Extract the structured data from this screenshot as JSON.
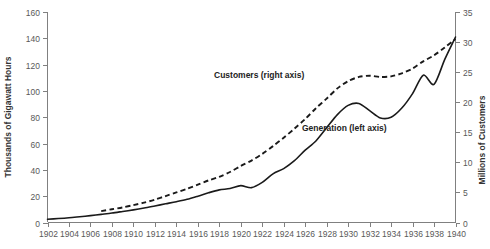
{
  "chart_data": {
    "type": "line",
    "title": "",
    "xlabel": "",
    "ylabel": "Thousands of Gigawatt Hours",
    "y2label": "Millions of Customers",
    "xlim": [
      1902,
      1940
    ],
    "ylim": [
      0,
      160
    ],
    "y2lim": [
      0,
      35
    ],
    "grid": false,
    "legend_position": "inline-annotations",
    "x_ticks": [
      1902,
      1904,
      1906,
      1908,
      1910,
      1912,
      1914,
      1916,
      1918,
      1920,
      1922,
      1924,
      1926,
      1928,
      1930,
      1932,
      1934,
      1936,
      1938,
      1940
    ],
    "y_ticks": [
      0,
      20,
      40,
      60,
      80,
      100,
      120,
      140,
      160
    ],
    "y2_ticks": [
      0,
      5,
      10,
      15,
      20,
      25,
      30,
      35
    ],
    "annotations": [
      {
        "text": "Customers (right axis)",
        "x": 1925,
        "y_axis": "right"
      },
      {
        "text": "Generation (left axis)",
        "x": 1931,
        "y_axis": "left"
      }
    ],
    "series": [
      {
        "name": "Generation (left axis)",
        "axis": "left",
        "style": "solid",
        "unit": "Thousands of Gigawatt Hours",
        "x": [
          1902,
          1903,
          1904,
          1905,
          1906,
          1907,
          1908,
          1909,
          1910,
          1911,
          1912,
          1913,
          1914,
          1915,
          1916,
          1917,
          1918,
          1919,
          1920,
          1921,
          1922,
          1923,
          1924,
          1925,
          1926,
          1927,
          1928,
          1929,
          1930,
          1931,
          1932,
          1933,
          1934,
          1935,
          1936,
          1937,
          1938,
          1939,
          1940
        ],
        "values": [
          2.5,
          3.0,
          3.6,
          4.4,
          5.2,
          6.2,
          7.2,
          8.4,
          9.6,
          11.0,
          12.6,
          14.2,
          15.8,
          17.6,
          20.0,
          22.6,
          24.8,
          25.8,
          28.0,
          26.5,
          30.5,
          37.0,
          41.0,
          47.0,
          55.0,
          62.0,
          72.0,
          82.0,
          89.0,
          90.5,
          85.0,
          79.5,
          80.0,
          87.0,
          98.0,
          112.0,
          105.0,
          124.0,
          141.0
        ]
      },
      {
        "name": "Customers (right axis)",
        "axis": "right",
        "style": "dashed",
        "unit": "Millions of Customers",
        "x": [
          1907,
          1908,
          1909,
          1910,
          1911,
          1912,
          1913,
          1914,
          1915,
          1916,
          1917,
          1918,
          1919,
          1920,
          1921,
          1922,
          1923,
          1924,
          1925,
          1926,
          1927,
          1928,
          1929,
          1930,
          1931,
          1932,
          1933,
          1934,
          1935,
          1936,
          1937,
          1938,
          1939,
          1940
        ],
        "values": [
          1.9,
          2.2,
          2.5,
          2.9,
          3.3,
          3.8,
          4.4,
          5.0,
          5.6,
          6.3,
          7.0,
          7.6,
          8.4,
          9.4,
          10.3,
          11.4,
          12.7,
          14.1,
          15.6,
          17.2,
          19.0,
          20.6,
          22.3,
          23.5,
          24.2,
          24.4,
          24.2,
          24.3,
          24.8,
          25.6,
          26.8,
          27.8,
          29.1,
          30.5
        ]
      }
    ]
  }
}
